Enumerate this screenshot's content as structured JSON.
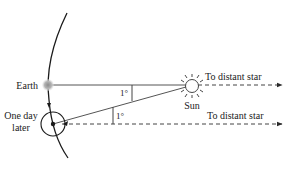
{
  "diagram": {
    "labels": {
      "earth": "Earth",
      "one_day_later_line1": "One day",
      "one_day_later_line2": "later",
      "sun": "Sun",
      "to_star_top": "To distant star",
      "to_star_bottom": "To distant star",
      "angle_top": "1°",
      "angle_bottom": "1°"
    },
    "colors": {
      "line": "#2a2a2a",
      "earth": "#9a9a9a",
      "background": "#ffffff"
    }
  }
}
